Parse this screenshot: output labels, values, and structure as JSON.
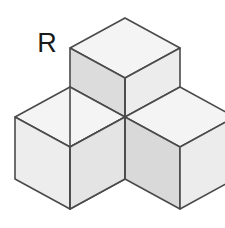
{
  "figure": {
    "label": "R",
    "label_x": 47,
    "label_y": 52,
    "type": "isometric-cube-assembly",
    "cube_count": 4,
    "background_color": "#ffffff",
    "stroke_color": "#4a4a4a",
    "stroke_width": 1.6,
    "face_colors": {
      "top": "#f4f4f4",
      "left": "#d5d5d5",
      "right": "#e9e9e9"
    },
    "projection": {
      "origin_x": 125,
      "origin_y": 117,
      "cube_edge": 62,
      "iso_dx": 55,
      "iso_dy": 30,
      "iso_dz": 62
    },
    "cubes": [
      {
        "name": "top-cube",
        "offset": [
          0,
          0,
          1
        ]
      },
      {
        "name": "left-cube",
        "offset": [
          -1,
          0,
          0
        ]
      },
      {
        "name": "right-cube",
        "offset": [
          0,
          -1,
          0
        ]
      },
      {
        "name": "centre-cube",
        "offset": [
          0,
          0,
          0
        ]
      }
    ]
  }
}
